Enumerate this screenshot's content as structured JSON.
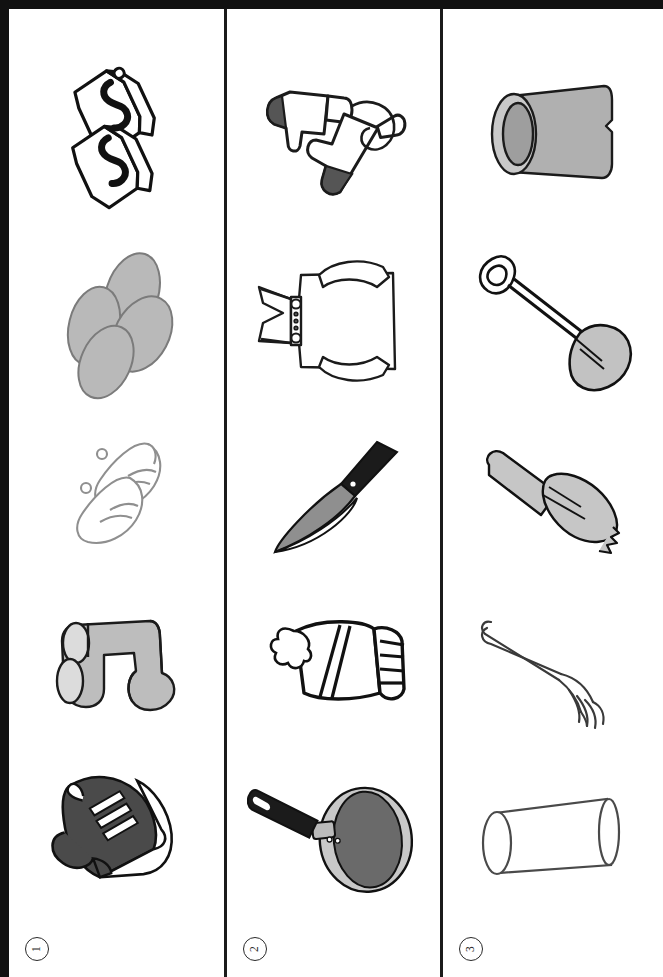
{
  "worksheet": {
    "orientation": "rotated-90-ccw",
    "page_border_color": "#111111",
    "divider_color": "#1b1b1b",
    "background": "#ffffff",
    "rows": [
      {
        "number_label": "1",
        "row_name": "row-1-footwear",
        "items": [
          {
            "name": "flip-flops",
            "label": "flip flops",
            "fill": "#ffffff",
            "stroke": "#111111"
          },
          {
            "name": "slippers",
            "label": "slippers",
            "fill": "#b9b9b9",
            "stroke": "#6e6e6e"
          },
          {
            "name": "ballet-shoes",
            "label": "ballet shoes",
            "fill": "#ffffff",
            "stroke": "#9a9a9a"
          },
          {
            "name": "socks",
            "label": "socks",
            "fill": "#bdbdbd",
            "stroke": "#1b1b1b"
          },
          {
            "name": "sneakers",
            "label": "sneakers",
            "fill": "#4a4a4a",
            "stroke": "#111111"
          }
        ]
      },
      {
        "number_label": "2",
        "row_name": "row-2-clothing-and-kitchen",
        "items": [
          {
            "name": "mittens",
            "label": "mittens",
            "fill": "#ffffff",
            "stroke": "#1b1b1b"
          },
          {
            "name": "shirt",
            "label": "shirt",
            "fill": "#ffffff",
            "stroke": "#1b1b1b"
          },
          {
            "name": "kitchen-knife",
            "label": "knife",
            "fill": "#8f8f8f",
            "stroke": "#111111"
          },
          {
            "name": "winter-hat",
            "label": "winter hat",
            "fill": "#ffffff",
            "stroke": "#111111"
          },
          {
            "name": "frying-pan",
            "label": "frying pan",
            "fill": "#9a9a9a",
            "stroke": "#111111"
          }
        ]
      },
      {
        "number_label": "3",
        "row_name": "row-3-garden-and-tableware",
        "items": [
          {
            "name": "flower-pot",
            "label": "flower pot",
            "fill": "#b0b0b0",
            "stroke": "#1b1b1b"
          },
          {
            "name": "shovel",
            "label": "shovel",
            "fill": "#c2c2c2",
            "stroke": "#111111"
          },
          {
            "name": "garden-trowel",
            "label": "garden trowel",
            "fill": "#c6c6c6",
            "stroke": "#111111"
          },
          {
            "name": "fork",
            "label": "fork",
            "fill": "#ffffff",
            "stroke": "#3a3a3a"
          },
          {
            "name": "drinking-glass",
            "label": "drinking glass",
            "fill": "#ffffff",
            "stroke": "#4a4a4a"
          }
        ]
      }
    ]
  }
}
